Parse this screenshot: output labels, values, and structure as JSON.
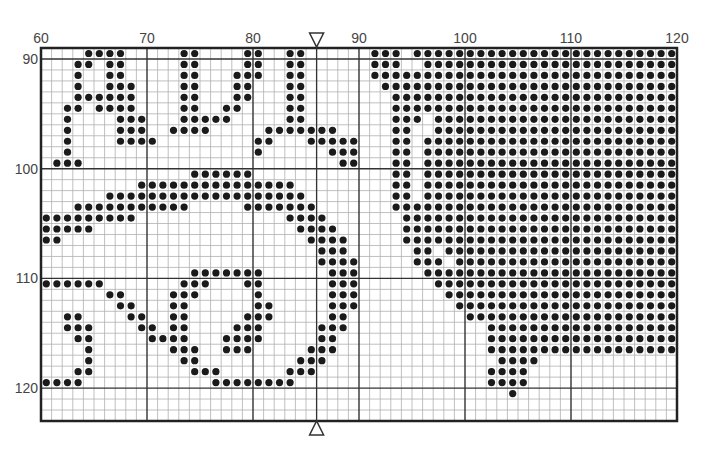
{
  "chart_data": {
    "type": "heatmap",
    "title": "",
    "grid": {
      "columns": 60,
      "rows": 34,
      "x_start": 60,
      "y_start": 89,
      "major_every": 10
    },
    "x_tick_labels": [
      "60",
      "70",
      "80",
      "90",
      "100",
      "110",
      "120"
    ],
    "y_tick_labels": [
      "90",
      "100",
      "110",
      "120"
    ],
    "center_marker_column_boundary": 26,
    "markers": [
      "top-down-triangle",
      "bottom-up-triangle"
    ],
    "rows": [
      [
        [
          4,
          7
        ],
        [
          13,
          14
        ],
        [
          19,
          20
        ],
        [
          23,
          24
        ],
        [
          31,
          33
        ],
        [
          35,
          59
        ]
      ],
      [
        [
          3,
          4
        ],
        [
          6,
          7
        ],
        [
          13,
          14
        ],
        [
          19,
          20
        ],
        [
          23,
          24
        ],
        [
          31,
          33
        ],
        [
          36,
          59
        ]
      ],
      [
        [
          3,
          3
        ],
        [
          6,
          7
        ],
        [
          13,
          14
        ],
        [
          18,
          20
        ],
        [
          23,
          24
        ],
        [
          31,
          59
        ]
      ],
      [
        [
          3,
          3
        ],
        [
          6,
          8
        ],
        [
          13,
          14
        ],
        [
          18,
          19
        ],
        [
          23,
          24
        ],
        [
          32,
          59
        ]
      ],
      [
        [
          3,
          8
        ],
        [
          13,
          14
        ],
        [
          18,
          19
        ],
        [
          23,
          24
        ],
        [
          33,
          59
        ]
      ],
      [
        [
          2,
          3
        ],
        [
          5,
          8
        ],
        [
          13,
          14
        ],
        [
          17,
          18
        ],
        [
          23,
          24
        ],
        [
          33,
          59
        ]
      ],
      [
        [
          2,
          2
        ],
        [
          7,
          9
        ],
        [
          13,
          17
        ],
        [
          23,
          24
        ],
        [
          33,
          35
        ],
        [
          37,
          59
        ]
      ],
      [
        [
          2,
          2
        ],
        [
          7,
          9
        ],
        [
          12,
          15
        ],
        [
          21,
          27
        ],
        [
          33,
          34
        ],
        [
          37,
          59
        ]
      ],
      [
        [
          2,
          2
        ],
        [
          7,
          10
        ],
        [
          20,
          21
        ],
        [
          25,
          29
        ],
        [
          33,
          34
        ],
        [
          36,
          59
        ]
      ],
      [
        [
          2,
          2
        ],
        [
          20,
          20
        ],
        [
          27,
          29
        ],
        [
          33,
          34
        ],
        [
          36,
          59
        ]
      ],
      [
        [
          1,
          3
        ],
        [
          28,
          29
        ],
        [
          33,
          34
        ],
        [
          36,
          59
        ]
      ],
      [
        [
          14,
          19
        ],
        [
          33,
          34
        ],
        [
          36,
          59
        ]
      ],
      [
        [
          9,
          23
        ],
        [
          33,
          34
        ],
        [
          36,
          59
        ]
      ],
      [
        [
          6,
          24
        ],
        [
          33,
          34
        ],
        [
          36,
          59
        ]
      ],
      [
        [
          3,
          13
        ],
        [
          19,
          25
        ],
        [
          33,
          59
        ]
      ],
      [
        [
          0,
          8
        ],
        [
          23,
          26
        ],
        [
          34,
          59
        ]
      ],
      [
        [
          0,
          4
        ],
        [
          24,
          27
        ],
        [
          34,
          59
        ]
      ],
      [
        [
          0,
          1
        ],
        [
          25,
          28
        ],
        [
          34,
          59
        ]
      ],
      [
        [
          26,
          28
        ],
        [
          35,
          36
        ],
        [
          38,
          59
        ]
      ],
      [
        [
          26,
          29
        ],
        [
          35,
          37
        ],
        [
          39,
          59
        ]
      ],
      [
        [
          14,
          20
        ],
        [
          27,
          29
        ],
        [
          36,
          59
        ]
      ],
      [
        [
          0,
          5
        ],
        [
          13,
          15
        ],
        [
          19,
          20
        ],
        [
          27,
          29
        ],
        [
          37,
          59
        ]
      ],
      [
        [
          6,
          7
        ],
        [
          12,
          14
        ],
        [
          20,
          20
        ],
        [
          27,
          29
        ],
        [
          38,
          59
        ]
      ],
      [
        [
          7,
          8
        ],
        [
          12,
          13
        ],
        [
          20,
          21
        ],
        [
          27,
          29
        ],
        [
          39,
          59
        ]
      ],
      [
        [
          2,
          3
        ],
        [
          8,
          9
        ],
        [
          12,
          13
        ],
        [
          19,
          21
        ],
        [
          27,
          28
        ],
        [
          40,
          59
        ]
      ],
      [
        [
          2,
          4
        ],
        [
          9,
          10
        ],
        [
          12,
          13
        ],
        [
          18,
          20
        ],
        [
          26,
          28
        ],
        [
          42,
          59
        ]
      ],
      [
        [
          3,
          4
        ],
        [
          10,
          13
        ],
        [
          17,
          20
        ],
        [
          26,
          27
        ],
        [
          42,
          59
        ]
      ],
      [
        [
          4,
          4
        ],
        [
          12,
          14
        ],
        [
          17,
          19
        ],
        [
          25,
          27
        ],
        [
          42,
          59
        ]
      ],
      [
        [
          4,
          4
        ],
        [
          13,
          14
        ],
        [
          24,
          26
        ],
        [
          43,
          46
        ]
      ],
      [
        [
          3,
          4
        ],
        [
          14,
          16
        ],
        [
          23,
          25
        ],
        [
          42,
          45
        ]
      ],
      [
        [
          0,
          3
        ],
        [
          16,
          23
        ],
        [
          42,
          45
        ]
      ],
      [
        [
          44,
          44
        ]
      ],
      [],
      []
    ],
    "colors": {
      "dot": "#1a1a1a",
      "minor_line": "#b0b0b0",
      "major_line": "#333333",
      "border": "#222222",
      "background": "#ffffff"
    }
  }
}
